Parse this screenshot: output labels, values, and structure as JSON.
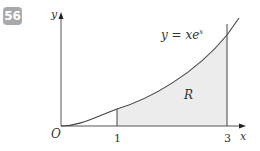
{
  "question_number": "56",
  "diagram": {
    "curve_label": "y = xe",
    "curve_label_exp": "x",
    "region_label": "R",
    "origin_label": "O",
    "x_axis_label": "x",
    "y_axis_label": "y",
    "x_ticks": [
      "1",
      "3"
    ],
    "colors": {
      "shade": "#ececec",
      "line": "#444444",
      "badge": "#a7a9ac"
    }
  }
}
